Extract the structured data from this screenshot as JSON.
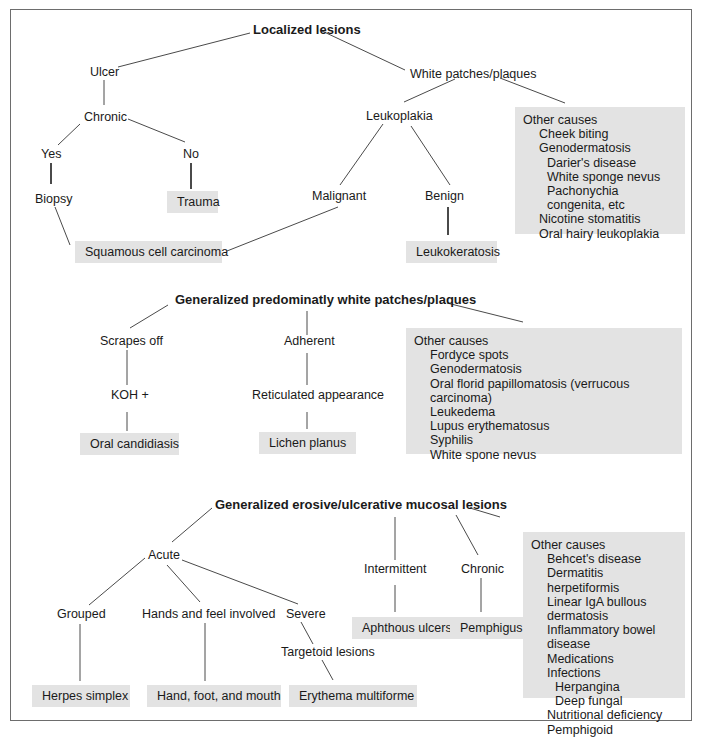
{
  "diagram": {
    "sections": [
      {
        "root": "Localized lesions",
        "nodes": {
          "ulcer": "Ulcer",
          "chronic": "Chronic",
          "yes": "Yes",
          "no": "No",
          "biopsy": "Biopsy",
          "trauma": "Trauma",
          "white_patches": "White patches/plaques",
          "leukoplakia": "Leukoplakia",
          "malignant": "Malignant",
          "benign": "Benign",
          "scc": "Squamous cell carcinoma",
          "leukokeratosis": "Leukokeratosis"
        },
        "other_causes": {
          "title": "Other causes",
          "items": [
            {
              "label": "Cheek biting",
              "level": 1
            },
            {
              "label": "Genodermatosis",
              "level": 1
            },
            {
              "label": "Darier's disease",
              "level": 2
            },
            {
              "label": "White sponge nevus",
              "level": 2
            },
            {
              "label": "Pachonychia congenita, etc",
              "level": 2
            },
            {
              "label": "Nicotine stomatitis",
              "level": 1
            },
            {
              "label": "Oral hairy leukoplakia",
              "level": 1
            }
          ]
        }
      },
      {
        "root": "Generalized predominatly white patches/plaques",
        "nodes": {
          "scrapes_off": "Scrapes off",
          "koh": "KOH +",
          "oral_candidiasis": "Oral candidiasis",
          "adherent": "Adherent",
          "reticulated": "Reticulated appearance",
          "lichen_planus": "Lichen planus"
        },
        "other_causes": {
          "title": "Other causes",
          "items": [
            {
              "label": "Fordyce spots",
              "level": 1
            },
            {
              "label": "Genodermatosis",
              "level": 1
            },
            {
              "label": "Oral florid papillomatosis (verrucous carcinoma)",
              "level": 1
            },
            {
              "label": "Leukedema",
              "level": 1
            },
            {
              "label": "Lupus erythematosus",
              "level": 1
            },
            {
              "label": "Syphilis",
              "level": 1
            },
            {
              "label": "White spone nevus",
              "level": 1
            }
          ]
        }
      },
      {
        "root": "Generalized erosive/ulcerative mucosal lesions",
        "nodes": {
          "acute": "Acute",
          "grouped": "Grouped",
          "hands_feet": "Hands and feel involved",
          "severe": "Severe",
          "targetoid": "Targetoid lesions",
          "herpes": "Herpes simplex",
          "hfm": "Hand, foot, and mouth",
          "erythema": "Erythema multiforme",
          "intermittent": "Intermittent",
          "chronic": "Chronic",
          "aphthous": "Aphthous ulcers",
          "pemphigus": "Pemphigus"
        },
        "other_causes": {
          "title": "Other causes",
          "items": [
            {
              "label": "Behcet's disease",
              "level": 1
            },
            {
              "label": "Dermatitis herpetiformis",
              "level": 1
            },
            {
              "label": "Linear IgA bullous dermatosis",
              "level": 1
            },
            {
              "label": "Inflammatory bowel disease",
              "level": 1
            },
            {
              "label": "Medications",
              "level": 1
            },
            {
              "label": "Infections",
              "level": 1
            },
            {
              "label": "Herpangina",
              "level": 2
            },
            {
              "label": "Deep fungal",
              "level": 2
            },
            {
              "label": "Nutritional deficiency",
              "level": 1
            },
            {
              "label": "Pemphigoid",
              "level": 1
            }
          ]
        }
      }
    ],
    "colors": {
      "box_fill": "#e3e3e3",
      "line": "#4a4a4a",
      "frame": "#6d6d6d"
    }
  }
}
